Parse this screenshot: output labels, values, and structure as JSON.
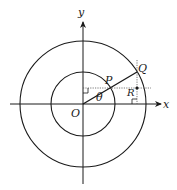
{
  "diagram": {
    "type": "geometry",
    "axes": {
      "x_label": "x",
      "y_label": "y"
    },
    "points": {
      "origin": "O",
      "inner_point": "P",
      "outer_point": "Q",
      "intersection_point": "R"
    },
    "angle_label": "θ",
    "colors": {
      "stroke": "#1a1a1a",
      "dotted": "#555555",
      "background": "#ffffff"
    }
  }
}
